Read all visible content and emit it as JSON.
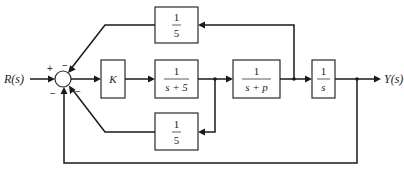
{
  "diagram": {
    "type": "control-system-block-diagram",
    "input_label": "R(s)",
    "output_label": "Y(s)",
    "summing_junction": {
      "signs": {
        "input_left": "+",
        "top_feedback": "−",
        "lower_inner_feedback": "−",
        "bottom_outer_feedback": "−"
      }
    },
    "forward_blocks": [
      {
        "id": "gain",
        "numerator": "K",
        "denominator": ""
      },
      {
        "id": "g1",
        "numerator": "1",
        "denominator": "s + 5"
      },
      {
        "id": "g2",
        "numerator": "1",
        "denominator": "s + p"
      },
      {
        "id": "integrator",
        "numerator": "1",
        "denominator": "s"
      }
    ],
    "feedback_blocks": [
      {
        "id": "upper_feedback",
        "numerator": "1",
        "denominator": "5",
        "from": "output of 1/(s+p)"
      },
      {
        "id": "lower_feedback",
        "numerator": "1",
        "denominator": "5",
        "from": "output of 1/(s+5)"
      }
    ],
    "outer_feedback": {
      "from": "Y(s)",
      "gain": "unity"
    }
  }
}
